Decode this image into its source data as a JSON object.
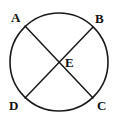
{
  "figure": {
    "kind": "geometry-diagram",
    "width": 118,
    "height": 125,
    "background_color": "#ffffff",
    "stroke_color": "#1a1a1a",
    "label_color": "#111111",
    "circle": {
      "center_x": 59,
      "center_y": 62,
      "radius": 49,
      "stroke_width": 1.6
    },
    "chords": [
      {
        "name": "chord-AC",
        "from": "A",
        "to": "C",
        "x1": 25,
        "y1": 26,
        "x2": 93,
        "y2": 98,
        "stroke_width": 1.5
      },
      {
        "name": "chord-BD",
        "from": "B",
        "to": "D",
        "x1": 93,
        "y1": 27,
        "x2": 25,
        "y2": 98,
        "stroke_width": 1.5
      }
    ],
    "labels": {
      "a": "A",
      "b": "B",
      "c": "C",
      "d": "D",
      "e": "E"
    },
    "points": [
      {
        "label": "A",
        "x": 25,
        "y": 26,
        "on_circle": true
      },
      {
        "label": "B",
        "x": 93,
        "y": 27,
        "on_circle": true
      },
      {
        "label": "C",
        "x": 93,
        "y": 98,
        "on_circle": true
      },
      {
        "label": "D",
        "x": 25,
        "y": 98,
        "on_circle": true
      },
      {
        "label": "E",
        "x": 59,
        "y": 62,
        "on_circle": false
      }
    ]
  }
}
